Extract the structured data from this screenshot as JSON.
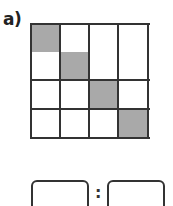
{
  "exercise": {
    "label": "a)",
    "grid": {
      "columns": 4,
      "rows": 4,
      "shaded_cells": [
        [
          0,
          0
        ],
        [
          1,
          1
        ],
        [
          2,
          2
        ],
        [
          3,
          3
        ]
      ],
      "shade_color": "#a9a9a9",
      "line_color": "#333333"
    },
    "ratio": {
      "left_value": "",
      "separator": ":",
      "right_value": ""
    }
  }
}
